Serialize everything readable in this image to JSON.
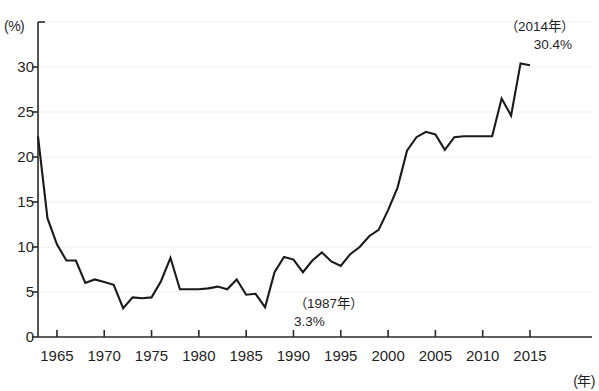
{
  "chart_data": {
    "type": "line",
    "title": "",
    "subtitle": "",
    "xlabel": "(年)",
    "ylabel": "(%)",
    "xlim": [
      1963,
      2015
    ],
    "ylim": [
      0,
      35
    ],
    "grid": true,
    "legend": null,
    "y_ticks": [
      0,
      5,
      10,
      15,
      20,
      25,
      30
    ],
    "y_tick_labels": [
      "0",
      "5",
      "10",
      "15",
      "20",
      "25",
      "30"
    ],
    "x_ticks": [
      1965,
      1970,
      1975,
      1980,
      1985,
      1990,
      1995,
      2000,
      2005,
      2010,
      2015
    ],
    "x_tick_labels": [
      "1965",
      "1970",
      "1975",
      "1980",
      "1985",
      "1990",
      "1995",
      "2000",
      "2005",
      "2010",
      "2015"
    ],
    "series": [
      {
        "name": "",
        "color": "#1a1a1a",
        "x": [
          1963,
          1964,
          1965,
          1966,
          1967,
          1968,
          1969,
          1970,
          1971,
          1972,
          1973,
          1974,
          1975,
          1976,
          1977,
          1978,
          1979,
          1980,
          1981,
          1982,
          1983,
          1984,
          1985,
          1986,
          1987,
          1988,
          1989,
          1990,
          1991,
          1992,
          1993,
          1994,
          1995,
          1996,
          1997,
          1998,
          1999,
          2000,
          2001,
          2002,
          2003,
          2004,
          2005,
          2006,
          2007,
          2008,
          2009,
          2010,
          2011,
          2012,
          2013,
          2014,
          2015
        ],
        "y": [
          22.3,
          13.2,
          10.3,
          8.5,
          8.5,
          6.0,
          6.4,
          6.1,
          5.8,
          3.2,
          4.4,
          4.3,
          4.4,
          6.2,
          8.8,
          5.3,
          5.3,
          5.3,
          5.4,
          5.6,
          5.3,
          6.4,
          4.7,
          4.8,
          3.3,
          7.2,
          8.9,
          8.6,
          7.2,
          8.5,
          9.4,
          8.4,
          7.9,
          9.2,
          10.0,
          11.2,
          11.9,
          14.1,
          16.6,
          20.7,
          22.2,
          22.8,
          22.5,
          20.8,
          22.2,
          22.3,
          22.3,
          22.3,
          22.3,
          26.5,
          24.6,
          30.4,
          30.2
        ]
      }
    ],
    "annotations": [
      {
        "id": "peak-2014",
        "year_label": "（2014年）",
        "value_label": "30.4%",
        "x": 2014,
        "y": 30.4
      },
      {
        "id": "trough-1987",
        "year_label": "（1987年）",
        "value_label": "3.3%",
        "x": 1987,
        "y": 3.3
      }
    ]
  },
  "axis": {
    "y_unit": "(%)",
    "x_unit": "(年)"
  },
  "colors": {
    "line": "#1a1a1a",
    "axis": "#2a2a2a",
    "grid": "#f0f0f2",
    "background": "#ffffff",
    "text": "#1f1f1f"
  }
}
